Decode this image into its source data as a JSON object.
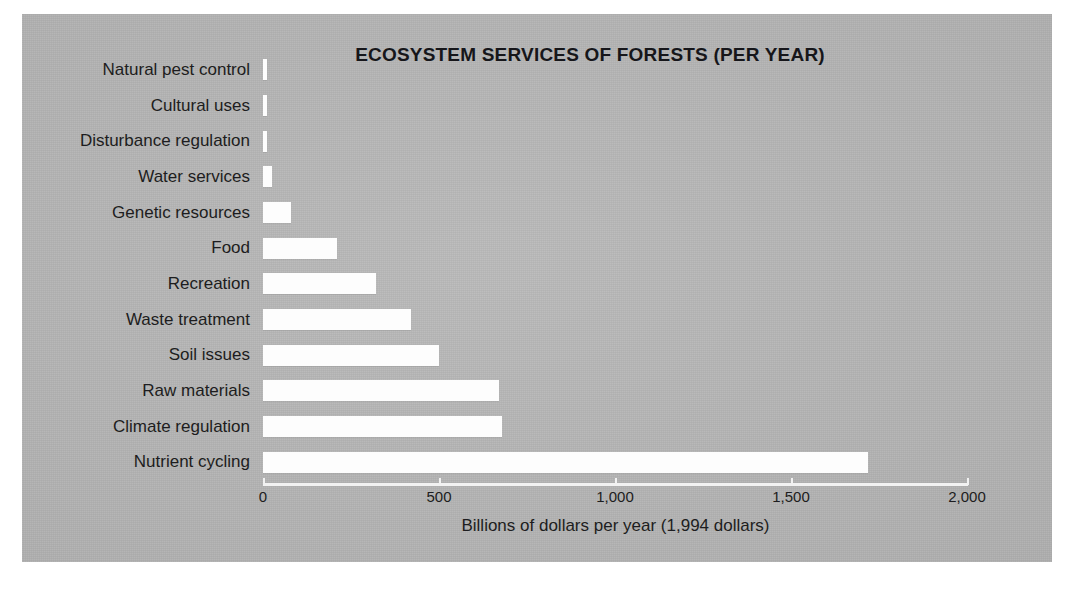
{
  "figure": {
    "panel_color": "#b6b6b6",
    "bar_color": "#fdfdfd",
    "axis_color": "#f2f2f2",
    "text_color": "#1d1d20"
  },
  "chart_data": {
    "type": "bar",
    "orientation": "horizontal",
    "title": "ECOSYSTEM SERVICES OF FORESTS (PER YEAR)",
    "xlabel": "Billions of dollars per year (1,994 dollars)",
    "ylabel": "",
    "xlim": [
      0,
      2000
    ],
    "grid": false,
    "legend": null,
    "xticks": [
      0,
      500,
      1000,
      1500,
      2000
    ],
    "xticklabels": [
      "0",
      "500",
      "1,000",
      "1,500",
      "2,000"
    ],
    "categories": [
      "Natural pest control",
      "Cultural uses",
      "Disturbance regulation",
      "Water services",
      "Genetic resources",
      "Food",
      "Recreation",
      "Waste treatment",
      "Soil issues",
      "Raw materials",
      "Climate regulation",
      "Nutrient cycling"
    ],
    "values": [
      10,
      10,
      12,
      25,
      80,
      210,
      320,
      420,
      500,
      670,
      680,
      1720
    ],
    "value_unit": "billions of dollars per year (1994 dollars)"
  }
}
